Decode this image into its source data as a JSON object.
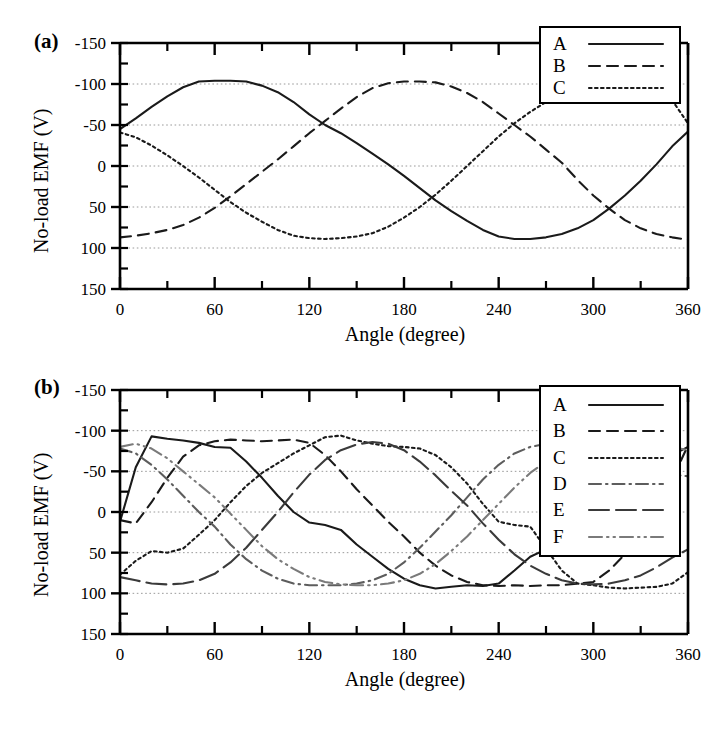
{
  "figure": {
    "panels": [
      {
        "id": "a",
        "label": "(a)",
        "legend": {
          "entries": [
            "A",
            "B",
            "C"
          ]
        }
      },
      {
        "id": "b",
        "label": "(b)",
        "legend": {
          "entries": [
            "A",
            "B",
            "C",
            "D",
            "E",
            "F"
          ]
        }
      }
    ]
  },
  "axes": {
    "xlabel": "Angle (degree)",
    "ylabel": "No-load EMF (V)",
    "xticks": [
      "0",
      "60",
      "120",
      "180",
      "240",
      "300",
      "360"
    ],
    "yticks": [
      "150",
      "100",
      "50",
      "0",
      "-50",
      "-100",
      "-150"
    ]
  },
  "colors": {
    "ink": "#1a1a1a",
    "grid": "#9a9a9a",
    "background": "#ffffff"
  },
  "chart_data": [
    {
      "type": "line",
      "panel": "(a)",
      "title": "",
      "xlabel": "Angle (degree)",
      "ylabel": "No-load EMF (V)",
      "xlim": [
        0,
        360
      ],
      "ylim": [
        -150,
        150
      ],
      "xticks": [
        0,
        60,
        120,
        180,
        240,
        300,
        360
      ],
      "yticks": [
        -150,
        -100,
        -50,
        0,
        50,
        100,
        150
      ],
      "grid": "horizontal-dotted",
      "legend_position": "top-right",
      "x": [
        0,
        10,
        20,
        30,
        40,
        50,
        60,
        70,
        80,
        90,
        100,
        110,
        120,
        130,
        140,
        150,
        160,
        170,
        180,
        190,
        200,
        210,
        220,
        230,
        240,
        250,
        260,
        270,
        280,
        290,
        300,
        310,
        320,
        330,
        340,
        350,
        360
      ],
      "series": [
        {
          "name": "A",
          "style": "solid",
          "values": [
            45,
            58,
            72,
            85,
            96,
            103,
            104,
            104,
            103,
            98,
            90,
            78,
            63,
            50,
            40,
            28,
            15,
            2,
            -12,
            -27,
            -42,
            -55,
            -67,
            -78,
            -86,
            -89,
            -89,
            -87,
            -83,
            -76,
            -66,
            -52,
            -36,
            -18,
            2,
            24,
            42
          ]
        },
        {
          "name": "B",
          "style": "dashed",
          "values": [
            -87,
            -85,
            -82,
            -78,
            -72,
            -63,
            -51,
            -37,
            -22,
            -7,
            8,
            24,
            40,
            55,
            70,
            84,
            95,
            101,
            103,
            103,
            102,
            97,
            89,
            78,
            64,
            50,
            36,
            20,
            4,
            -17,
            -36,
            -52,
            -66,
            -76,
            -83,
            -87,
            -90
          ]
        },
        {
          "name": "C",
          "style": "dotted",
          "values": [
            41,
            35,
            25,
            13,
            0,
            -14,
            -29,
            -44,
            -57,
            -68,
            -78,
            -85,
            -88,
            -89,
            -88,
            -86,
            -82,
            -74,
            -63,
            -50,
            -35,
            -18,
            0,
            18,
            36,
            52,
            66,
            78,
            88,
            96,
            101,
            103,
            103,
            101,
            94,
            80,
            52
          ]
        }
      ]
    },
    {
      "type": "line",
      "panel": "(b)",
      "title": "",
      "xlabel": "Angle (degree)",
      "ylabel": "No-load EMF (V)",
      "xlim": [
        0,
        360
      ],
      "ylim": [
        -150,
        150
      ],
      "xticks": [
        0,
        60,
        120,
        180,
        240,
        300,
        360
      ],
      "yticks": [
        -150,
        -100,
        -50,
        0,
        50,
        100,
        150
      ],
      "grid": "horizontal-dotted",
      "legend_position": "top-right",
      "x": [
        0,
        10,
        20,
        30,
        40,
        50,
        60,
        70,
        80,
        90,
        100,
        110,
        120,
        130,
        140,
        150,
        160,
        170,
        180,
        190,
        200,
        210,
        220,
        230,
        240,
        250,
        260,
        270,
        280,
        290,
        300,
        310,
        320,
        330,
        340,
        350,
        360
      ],
      "series": [
        {
          "name": "A",
          "style": "solid",
          "values": [
            -12,
            55,
            93,
            90,
            88,
            85,
            80,
            79,
            62,
            42,
            20,
            0,
            -13,
            -16,
            -22,
            -40,
            -55,
            -70,
            -82,
            -90,
            -94,
            -92,
            -90,
            -91,
            -88,
            -72,
            -55,
            -46,
            -44,
            -42,
            -30,
            -12,
            8,
            30,
            52,
            70,
            80
          ]
        },
        {
          "name": "B",
          "style": "dashed",
          "values": [
            -10,
            -14,
            12,
            42,
            68,
            82,
            87,
            89,
            88,
            87,
            88,
            89,
            85,
            70,
            50,
            28,
            8,
            -12,
            -30,
            -50,
            -66,
            -78,
            -86,
            -90,
            -91,
            -90,
            -91,
            -90,
            -90,
            -88,
            -86,
            -72,
            -52,
            -30,
            -6,
            40,
            82
          ]
        },
        {
          "name": "C",
          "style": "dotted",
          "values": [
            -77,
            -60,
            -48,
            -50,
            -45,
            -28,
            -10,
            12,
            32,
            48,
            60,
            72,
            82,
            92,
            94,
            88,
            84,
            81,
            80,
            78,
            70,
            55,
            35,
            10,
            -12,
            -16,
            -18,
            -45,
            -72,
            -88,
            -90,
            -93,
            -94,
            -93,
            -92,
            -88,
            -74
          ]
        },
        {
          "name": "D",
          "style": "dashdot",
          "values": [
            78,
            72,
            58,
            40,
            20,
            0,
            -18,
            -40,
            -58,
            -72,
            -82,
            -88,
            -90,
            -90,
            -90,
            -88,
            -84,
            -76,
            -62,
            -44,
            -24,
            -4,
            18,
            40,
            58,
            72,
            80,
            84,
            86,
            85,
            84,
            82,
            78,
            70,
            58,
            46,
            44
          ]
        },
        {
          "name": "E",
          "style": "longdash",
          "values": [
            -80,
            -84,
            -88,
            -89,
            -88,
            -84,
            -76,
            -62,
            -44,
            -22,
            0,
            24,
            46,
            64,
            76,
            83,
            86,
            84,
            76,
            62,
            45,
            26,
            8,
            -14,
            -34,
            -52,
            -66,
            -76,
            -84,
            -88,
            -89,
            -88,
            -84,
            -78,
            -68,
            -56,
            -46
          ]
        },
        {
          "name": "F",
          "style": "dashdotdot",
          "values": [
            80,
            84,
            78,
            66,
            50,
            34,
            18,
            -2,
            -22,
            -42,
            -58,
            -70,
            -80,
            -86,
            -89,
            -90,
            -90,
            -88,
            -84,
            -76,
            -64,
            -48,
            -30,
            -10,
            10,
            30,
            48,
            62,
            74,
            82,
            86,
            88,
            88,
            86,
            84,
            80,
            76
          ]
        }
      ]
    }
  ]
}
